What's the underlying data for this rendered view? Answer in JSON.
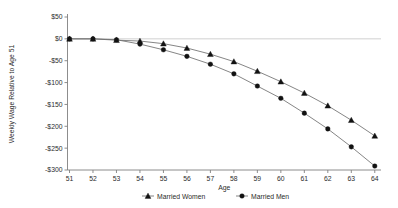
{
  "chart_data": {
    "type": "line",
    "title": "",
    "subtitle": "",
    "xlabel": "Age",
    "ylabel": "Weekly Wage Relative to Age 51",
    "categories": [
      51,
      52,
      53,
      54,
      55,
      56,
      57,
      58,
      59,
      60,
      61,
      62,
      63,
      64
    ],
    "x_tick_labels": [
      "51",
      "52",
      "53",
      "54",
      "55",
      "56",
      "57",
      "58",
      "59",
      "60",
      "61",
      "62",
      "63",
      "64"
    ],
    "y_tick_labels": [
      "$50",
      "$0",
      "-$50",
      "-$100",
      "-$150",
      "-$200",
      "-$250",
      "-$300"
    ],
    "y_tick_values": [
      50,
      0,
      -50,
      -100,
      -150,
      -200,
      -250,
      -300
    ],
    "ylim": [
      -300,
      50
    ],
    "xlim": [
      51,
      64
    ],
    "grid": false,
    "zero_line": true,
    "legend_position": "bottom",
    "series": [
      {
        "name": "Married Women",
        "marker": "triangle",
        "color": "#000000",
        "values": [
          0,
          0,
          -3,
          -5,
          -11,
          -21,
          -35,
          -52,
          -74,
          -98,
          -124,
          -153,
          -186,
          -222
        ]
      },
      {
        "name": "Married Men",
        "marker": "circle",
        "color": "#000000",
        "values": [
          0,
          0,
          -2,
          -12,
          -25,
          -40,
          -58,
          -80,
          -108,
          -136,
          -170,
          -206,
          -247,
          -291
        ]
      }
    ]
  },
  "legend": {
    "entries": [
      {
        "label": "Married Women",
        "marker": "triangle"
      },
      {
        "label": "Married Men",
        "marker": "circle"
      }
    ]
  },
  "axes": {
    "x_title": "Age",
    "y_title": "Weekly Wage Relative to Age 51"
  },
  "colors": {
    "line": "#6f6f6f",
    "marker": "#121212",
    "axis": "#808080",
    "zero_line": "#bbbbbb",
    "text": "#2b2b2b",
    "background": "#ffffff"
  }
}
